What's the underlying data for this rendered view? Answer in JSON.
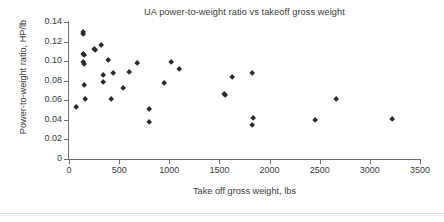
{
  "chart_data": {
    "type": "scatter",
    "title": "UA power-to-weight ratio vs takeoff gross weight",
    "xlabel": "Take off gross weight, lbs",
    "ylabel": "Power-to-weight ratio, HP/lb",
    "xlim": [
      0,
      3500
    ],
    "ylim": [
      0,
      0.14
    ],
    "xticks": [
      0,
      500,
      1000,
      1500,
      2000,
      2500,
      3000,
      3500
    ],
    "xtick_labels": [
      "0",
      "500",
      "1000",
      "1500",
      "2000",
      "2500",
      "3000",
      "3500"
    ],
    "yticks": [
      0,
      0.02,
      0.04,
      0.06,
      0.08,
      0.1,
      0.12,
      0.14
    ],
    "ytick_labels": [
      "0",
      "0.02",
      "0.04",
      "0.06",
      "0.08",
      "0.10",
      "0.12",
      "0.14"
    ],
    "grid": false,
    "legend": false,
    "marker": "diamond",
    "marker_color": "#2b2b2b",
    "series": [
      {
        "name": "UA aircraft",
        "points": [
          [
            70,
            0.053
          ],
          [
            140,
            0.13
          ],
          [
            145,
            0.128
          ],
          [
            140,
            0.107
          ],
          [
            150,
            0.106
          ],
          [
            145,
            0.099
          ],
          [
            148,
            0.097
          ],
          [
            150,
            0.075
          ],
          [
            165,
            0.061
          ],
          [
            250,
            0.112
          ],
          [
            260,
            0.111
          ],
          [
            320,
            0.116
          ],
          [
            340,
            0.086
          ],
          [
            345,
            0.079
          ],
          [
            390,
            0.101
          ],
          [
            420,
            0.061
          ],
          [
            445,
            0.088
          ],
          [
            545,
            0.072
          ],
          [
            600,
            0.089
          ],
          [
            680,
            0.098
          ],
          [
            800,
            0.051
          ],
          [
            800,
            0.038
          ],
          [
            950,
            0.077
          ],
          [
            1020,
            0.099
          ],
          [
            1100,
            0.092
          ],
          [
            1545,
            0.066
          ],
          [
            1560,
            0.065
          ],
          [
            1630,
            0.084
          ],
          [
            1825,
            0.035
          ],
          [
            1840,
            0.042
          ],
          [
            1830,
            0.088
          ],
          [
            2450,
            0.04
          ],
          [
            2660,
            0.061
          ],
          [
            3220,
            0.041
          ]
        ]
      }
    ]
  }
}
